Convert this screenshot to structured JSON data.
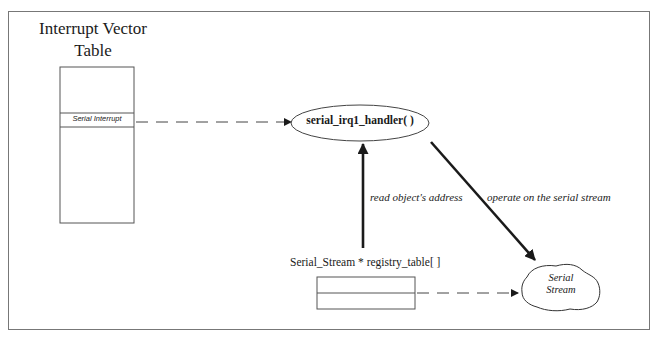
{
  "diagram": {
    "interrupt_vector_table": {
      "title_line1": "Interrupt Vector",
      "title_line2": "Table",
      "highlighted_entry": "Serial Interrupt"
    },
    "handler": {
      "label": "serial_irq1_handler( )"
    },
    "registry": {
      "label": "Serial_Stream * registry_table[ ]",
      "visible_slots": 2
    },
    "serial_stream": {
      "line1": "Serial",
      "line2": "Stream"
    },
    "edges": [
      {
        "from": "Serial Interrupt",
        "to": "serial_irq1_handler( )",
        "style": "dashed",
        "label": ""
      },
      {
        "from": "registry_table",
        "to": "serial_irq1_handler( )",
        "style": "solid-bold",
        "label": "read object's address"
      },
      {
        "from": "serial_irq1_handler( )",
        "to": "Serial Stream",
        "style": "solid-bold",
        "label": "operate on the serial stream"
      },
      {
        "from": "registry_table",
        "to": "Serial Stream",
        "style": "dashed",
        "label": ""
      }
    ],
    "colors": {
      "line": "#1a1a1a",
      "frame": "#777777",
      "background": "#ffffff"
    }
  }
}
